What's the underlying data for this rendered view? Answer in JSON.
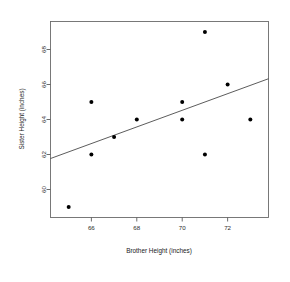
{
  "chart_data": {
    "type": "scatter",
    "title": "",
    "xlabel": "Brother Height (inches)",
    "ylabel": "Sister Height (inches)",
    "xlim": [
      64.2,
      73.8
    ],
    "ylim": [
      58.4,
      69.6
    ],
    "xticks": [
      66,
      68,
      70,
      72
    ],
    "yticks": [
      60,
      62,
      64,
      66,
      68
    ],
    "xtick_labels": [
      "66",
      "68",
      "70",
      "72"
    ],
    "ytick_labels": [
      "60",
      "62",
      "64",
      "66",
      "68"
    ],
    "grid": false,
    "legend": false,
    "x": [
      65,
      66,
      66,
      67,
      68,
      70,
      70,
      71,
      71,
      72,
      73
    ],
    "y": [
      59,
      62,
      65,
      63,
      64,
      64,
      65,
      62,
      69,
      66,
      64
    ],
    "points": [
      {
        "x": 65,
        "y": 59
      },
      {
        "x": 66,
        "y": 62
      },
      {
        "x": 66,
        "y": 65
      },
      {
        "x": 67,
        "y": 63
      },
      {
        "x": 68,
        "y": 64
      },
      {
        "x": 70,
        "y": 64
      },
      {
        "x": 70,
        "y": 65
      },
      {
        "x": 71,
        "y": 62
      },
      {
        "x": 71,
        "y": 69
      },
      {
        "x": 72,
        "y": 66
      },
      {
        "x": 73,
        "y": 64
      }
    ],
    "point_color": "#000000",
    "point_size": 2.0,
    "trendline": {
      "type": "linear",
      "x_start": 64.2,
      "y_start": 61.77,
      "x_end": 73.8,
      "y_end": 66.33,
      "color": "#4a4a4a"
    }
  },
  "axes": {
    "x_title": "Brother Height (inches)",
    "y_title": "Sister Height (inches)"
  }
}
